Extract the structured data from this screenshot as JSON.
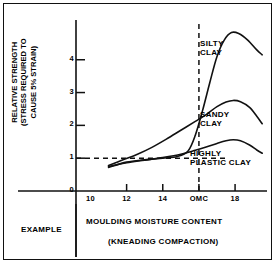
{
  "chart_data": {
    "type": "line",
    "title": "",
    "xlabel": "MOULDING MOISTURE CONTENT",
    "xsublabel": "(KNEADING COMPACTION)",
    "ylabel": "RELATIVE STRENGTH\n(STRESS REQUIRED TO\nCAUSE 5% STRAIN)",
    "xlim": [
      9.2,
      19.6
    ],
    "ylim": [
      0,
      5.15
    ],
    "grid": false,
    "legend_position": "inline-annotations",
    "xticks": [
      {
        "value": 10,
        "label": "10"
      },
      {
        "value": 12,
        "label": "12"
      },
      {
        "value": 14,
        "label": "14"
      },
      {
        "value": 16,
        "label": "OMC"
      },
      {
        "value": 18,
        "label": "18"
      }
    ],
    "yticks": [
      {
        "value": 0,
        "label": "0"
      },
      {
        "value": 1,
        "label": "1"
      },
      {
        "value": 2,
        "label": "2"
      },
      {
        "value": 3,
        "label": "3"
      },
      {
        "value": 4,
        "label": "4"
      }
    ],
    "reference_lines": [
      {
        "name": "unit-strength",
        "orientation": "horizontal",
        "value": 1,
        "style": "dashed"
      },
      {
        "name": "omc",
        "orientation": "vertical",
        "value": 16,
        "style": "dashed"
      }
    ],
    "series": [
      {
        "name": "SILTY CLAY",
        "label": "SILTY\nCLAY",
        "x": [
          11.0,
          12.0,
          13.0,
          14.0,
          14.8,
          15.4,
          15.8,
          16.2,
          16.6,
          17.0,
          17.4,
          17.8,
          18.2,
          18.7,
          19.2,
          19.5
        ],
        "y": [
          0.72,
          0.88,
          0.95,
          1.0,
          1.05,
          1.22,
          1.7,
          2.45,
          3.3,
          4.1,
          4.6,
          4.83,
          4.8,
          4.6,
          4.3,
          4.15
        ]
      },
      {
        "name": "SANDY CLAY",
        "label": "SANDY\nCLAY",
        "x": [
          11.0,
          11.8,
          12.6,
          13.4,
          14.2,
          15.0,
          15.8,
          16.4,
          17.0,
          17.5,
          17.9,
          18.3,
          18.8,
          19.2,
          19.5
        ],
        "y": [
          0.78,
          0.95,
          1.12,
          1.33,
          1.58,
          1.85,
          2.12,
          2.33,
          2.57,
          2.71,
          2.76,
          2.72,
          2.55,
          2.28,
          2.05
        ]
      },
      {
        "name": "HIGHLY PLASTIC CLAY",
        "label": "HIGHLY\nPLASTIC CLAY",
        "x": [
          11.0,
          12.0,
          13.0,
          14.0,
          15.0,
          15.8,
          16.4,
          17.0,
          17.5,
          17.9,
          18.3,
          18.8,
          19.2,
          19.5
        ],
        "y": [
          0.75,
          0.86,
          0.94,
          1.02,
          1.12,
          1.24,
          1.34,
          1.45,
          1.53,
          1.56,
          1.53,
          1.4,
          1.25,
          1.15
        ]
      }
    ]
  },
  "caption": {
    "left": "EXAMPLE",
    "main": "MOULDING MOISTURE CONTENT",
    "sub": "(KNEADING COMPACTION)"
  }
}
